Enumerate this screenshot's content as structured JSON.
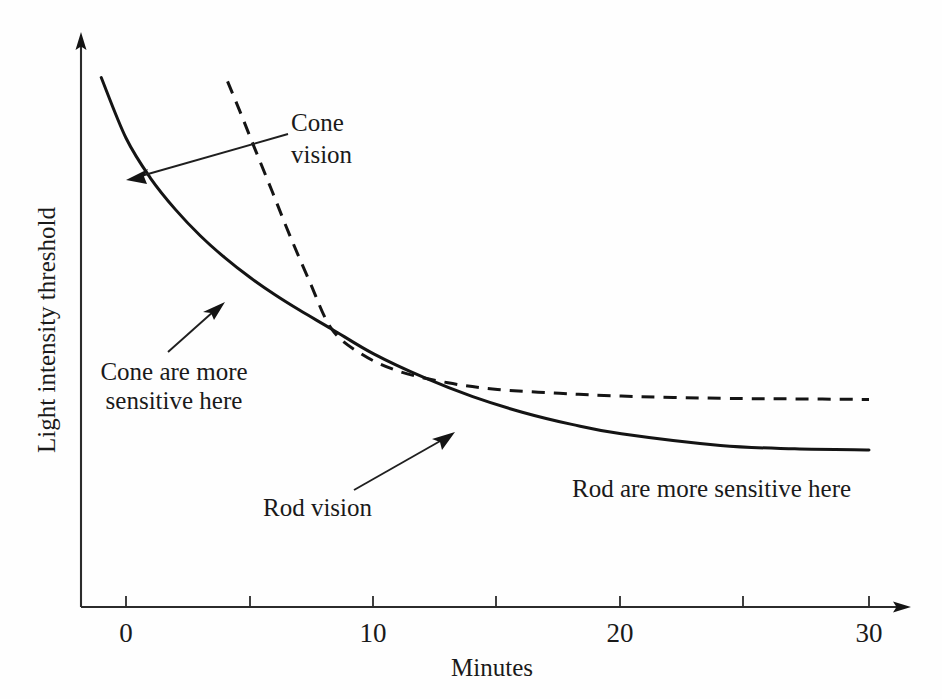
{
  "chart_data": {
    "type": "line",
    "title": "",
    "xlabel": "Minutes",
    "ylabel": "Light intensity threshold",
    "xlim": [
      -1,
      31
    ],
    "ylim": [
      0,
      1
    ],
    "grid": false,
    "legend": "none",
    "x_ticks": [
      0,
      5,
      10,
      15,
      20,
      25,
      30
    ],
    "x_tick_labels": [
      "0",
      "",
      "10",
      "",
      "20",
      "",
      "30"
    ],
    "y_ticks": [],
    "y_tick_labels": [],
    "axis_style": "arrow-terminated open axes, no y tick marks",
    "series": [
      {
        "name": "Rod vision",
        "style": "solid",
        "description": "Dark adaptation curve for rods: steep initial fall, rod-cone break near 8 minutes, plateaus low after ~20 minutes",
        "x": [
          -1.0,
          0.0,
          1.0,
          2.0,
          3.0,
          4.0,
          5.0,
          6.0,
          7.0,
          8.3,
          10.0,
          12.0,
          14.0,
          16.0,
          18.0,
          20.0,
          24.0,
          27.0,
          30.0
        ],
        "y": [
          0.954,
          0.845,
          0.772,
          0.716,
          0.669,
          0.629,
          0.594,
          0.563,
          0.535,
          0.501,
          0.456,
          0.414,
          0.379,
          0.351,
          0.329,
          0.312,
          0.291,
          0.285,
          0.283
        ]
      },
      {
        "name": "Cone vision",
        "style": "dashed",
        "description": "Dark adaptation curve for cones: begins later near 4 minutes, falls steeply, plateaus above the rod curve after ~15 minutes",
        "x": [
          4.1,
          4.6,
          5.2,
          5.9,
          6.6,
          7.4,
          8.3,
          9.5,
          11.0,
          13.0,
          15.0,
          17.5,
          20.0,
          24.0,
          27.0,
          30.0
        ],
        "y": [
          0.947,
          0.893,
          0.826,
          0.749,
          0.671,
          0.588,
          0.501,
          0.456,
          0.425,
          0.404,
          0.392,
          0.385,
          0.38,
          0.376,
          0.375,
          0.374
        ]
      }
    ],
    "crossover_point": {
      "x": 8.3,
      "y": 0.501,
      "label": "rod-cone break"
    },
    "annotations": [
      {
        "name": "cone-vision",
        "text_lines": [
          "Cone",
          "vision"
        ],
        "points_to_series": "Cone vision",
        "arrow_from_x": 14.0,
        "arrow_to_x": 1.3
      },
      {
        "name": "cone-are-more-sensitive-here",
        "text_lines": [
          "Cone are more",
          "sensitive here"
        ],
        "points_to_series": "Rod vision",
        "arrow_from_x": 3.7,
        "arrow_to_x": 5.7
      },
      {
        "name": "rod-vision",
        "text_lines": [
          "Rod vision"
        ],
        "points_to_series": "Rod vision",
        "arrow_from_x": 11.0,
        "arrow_to_x": 13.2
      },
      {
        "name": "rod-are-more-sensitive-here",
        "text_lines": [
          "Rod are more sensitive here"
        ],
        "points_to_series": "Rod vision",
        "arrow_from_x": null,
        "arrow_to_x": null
      }
    ],
    "colors": {
      "curve": "#141414",
      "axis": "#2b2b2b",
      "text": "#1a1a1a",
      "background": "#fefefe"
    }
  },
  "axes": {
    "x_title": "Minutes",
    "y_title": "Light intensity threshold",
    "tick_0": "0",
    "tick_10": "10",
    "tick_20": "20",
    "tick_30": "30"
  },
  "annotations": {
    "cone_vision_line1": "Cone",
    "cone_vision_line2": "vision",
    "cone_sensitive_line1": "Cone are more",
    "cone_sensitive_line2": "sensitive here",
    "rod_vision": "Rod vision",
    "rod_sensitive": "Rod are more sensitive here"
  }
}
